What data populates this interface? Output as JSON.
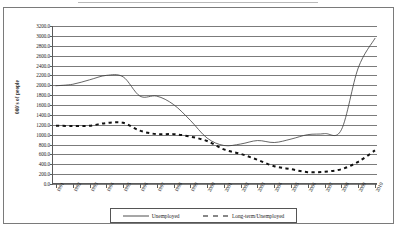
{
  "figure": {
    "ylabel": "000's of people"
  },
  "legend": {
    "position": "bottom-center",
    "entries": [
      {
        "label": "Unemployed",
        "style": "solid",
        "icon": "solid-line-swatch-icon"
      },
      {
        "label": "Long-term/Unemployed",
        "style": "dashed",
        "icon": "dashed-line-swatch-icon"
      }
    ]
  },
  "chart_data": {
    "type": "line",
    "title": "",
    "xlabel": "",
    "ylabel": "000's of people",
    "ylim": [
      0.0,
      3200.0
    ],
    "ytick_step": 200.0,
    "grid": true,
    "ytick_labels": [
      "3200.0",
      "3000.0",
      "2800.0",
      "2600.0",
      "2400.0",
      "2200.0",
      "2000.0",
      "1800.0",
      "1600.0",
      "1400.0",
      "1200.0",
      "1000.0",
      "800.0",
      "600.0",
      "400.0",
      "200.0",
      "0.0"
    ],
    "ytick_values": [
      3200.0,
      3000.0,
      2800.0,
      2600.0,
      2400.0,
      2200.0,
      2000.0,
      1800.0,
      1600.0,
      1400.0,
      1200.0,
      1000.0,
      800.0,
      600.0,
      400.0,
      200.0,
      0.0
    ],
    "categories": [
      "1991",
      "1992",
      "1993",
      "1994",
      "1995",
      "1996",
      "1997",
      "1998",
      "1999",
      "2000",
      "2001",
      "2002",
      "2003",
      "2004",
      "2005",
      "2006",
      "2007",
      "2008",
      "2009",
      "2010"
    ],
    "series": [
      {
        "name": "Unemployed",
        "style": "solid",
        "values": [
          1990,
          2020,
          2110,
          2200,
          2170,
          1780,
          1780,
          1610,
          1290,
          930,
          780,
          810,
          880,
          840,
          910,
          1000,
          1020,
          1100,
          2350,
          2950
        ]
      },
      {
        "name": "Long-term/Unemployed",
        "style": "dashed",
        "values": [
          1180,
          1175,
          1180,
          1235,
          1240,
          1080,
          1010,
          1010,
          960,
          870,
          700,
          610,
          490,
          360,
          300,
          240,
          250,
          300,
          450,
          680
        ]
      }
    ]
  }
}
